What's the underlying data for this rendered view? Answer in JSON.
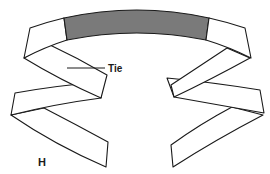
{
  "figure": {
    "label": "H",
    "annotations": [
      {
        "text": "Tie"
      }
    ],
    "colors": {
      "outline": "#1a1a1a",
      "shaded_band": "#7a7a7a",
      "background": "#ffffff"
    }
  }
}
